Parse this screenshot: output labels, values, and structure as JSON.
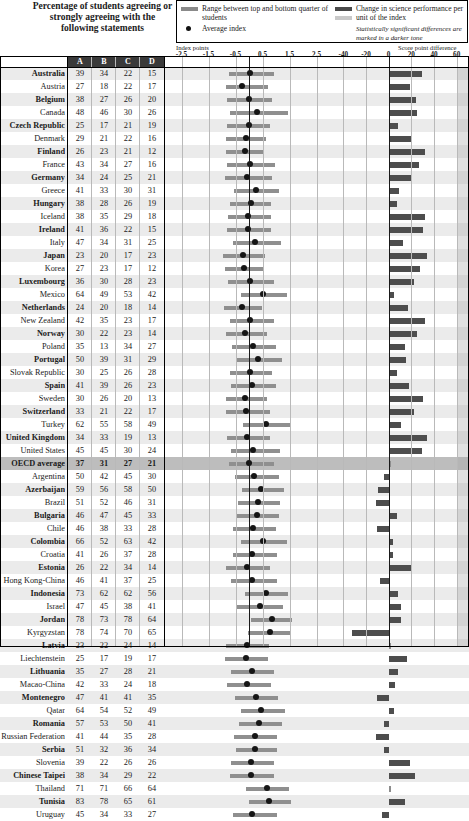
{
  "header": {
    "title": "Percentage of students agreeing or strongly agreeing with the following statements",
    "legend": {
      "range_label": "Range between top and bottom quarter of students",
      "average_label": "Average index",
      "change_label": "Change in science performance per unit of the index",
      "significance_note": "Statistically significant differences are marked in a darker tone"
    }
  },
  "axes": {
    "left_caption": "Index points",
    "right_caption": "Score point difference",
    "left_ticks": [
      "-2.5",
      "-1.5",
      "-0.5",
      "0.5",
      "1.5",
      "2.5"
    ],
    "right_ticks": [
      "-40",
      "-20",
      "0",
      "20",
      "40",
      "60"
    ],
    "left_range": [
      -3.0,
      3.0
    ],
    "right_range": [
      -50,
      70
    ]
  },
  "table": {
    "columns": [
      "A",
      "B",
      "C",
      "D"
    ]
  },
  "chart_data": {
    "type": "table",
    "title": "Percentage of students agreeing or strongly agreeing with the following statements",
    "xlabel": "Index points / Score point difference",
    "ylabel": "Country",
    "legend": [
      "Range between top and bottom quarter of students",
      "Average index",
      "Change in science performance per unit of the index"
    ],
    "categories": [
      "Australia",
      "Austria",
      "Belgium",
      "Canada",
      "Czech Republic",
      "Denmark",
      "Finland",
      "France",
      "Germany",
      "Greece",
      "Hungary",
      "Iceland",
      "Ireland",
      "Italy",
      "Japan",
      "Korea",
      "Luxembourg",
      "Mexico",
      "Netherlands",
      "New Zealand",
      "Norway",
      "Poland",
      "Portugal",
      "Slovak Republic",
      "Spain",
      "Sweden",
      "Switzerland",
      "Turkey",
      "United Kingdom",
      "United States",
      "OECD average",
      "Argentina",
      "Azerbaijan",
      "Brazil",
      "Bulgaria",
      "Chile",
      "Colombia",
      "Croatia",
      "Estonia",
      "Hong Kong-China",
      "Indonesia",
      "Israel",
      "Jordan",
      "Kyrgyzstan",
      "Latvia",
      "Liechtenstein",
      "Lithuania",
      "Macao-China",
      "Montenegro",
      "Qatar",
      "Romania",
      "Russian Federation",
      "Serbia",
      "Slovenia",
      "Chinese Taipei",
      "Thailand",
      "Tunisia",
      "Uruguay"
    ],
    "rows": [
      {
        "country": "Australia",
        "bold": true,
        "oecd": false,
        "A": 39,
        "B": 34,
        "C": 22,
        "D": 15,
        "index_low": -0.73,
        "index_high": 0.92,
        "index_avg": 0.03,
        "score_diff": 29,
        "significant": true
      },
      {
        "country": "Austria",
        "bold": false,
        "oecd": false,
        "A": 27,
        "B": 18,
        "C": 22,
        "D": 17,
        "index_low": -0.85,
        "index_high": 0.72,
        "index_avg": -0.27,
        "score_diff": 19,
        "significant": true
      },
      {
        "country": "Belgium",
        "bold": true,
        "oecd": false,
        "A": 38,
        "B": 27,
        "C": 26,
        "D": 20,
        "index_low": -0.8,
        "index_high": 0.86,
        "index_avg": 0.0,
        "score_diff": 24,
        "significant": true
      },
      {
        "country": "Canada",
        "bold": false,
        "oecd": false,
        "A": 48,
        "B": 46,
        "C": 30,
        "D": 26,
        "index_low": -0.7,
        "index_high": 1.45,
        "index_avg": 0.28,
        "score_diff": 25,
        "significant": true
      },
      {
        "country": "Czech Republic",
        "bold": true,
        "oecd": false,
        "A": 25,
        "B": 17,
        "C": 21,
        "D": 19,
        "index_low": -0.82,
        "index_high": 0.78,
        "index_avg": 0.0,
        "score_diff": 8,
        "significant": true
      },
      {
        "country": "Denmark",
        "bold": false,
        "oecd": false,
        "A": 29,
        "B": 21,
        "C": 22,
        "D": 16,
        "index_low": -0.84,
        "index_high": 0.62,
        "index_avg": -0.12,
        "score_diff": 20,
        "significant": true
      },
      {
        "country": "Finland",
        "bold": true,
        "oecd": false,
        "A": 26,
        "B": 23,
        "C": 21,
        "D": 12,
        "index_low": -0.86,
        "index_high": 0.52,
        "index_avg": -0.14,
        "score_diff": 32,
        "significant": true
      },
      {
        "country": "France",
        "bold": false,
        "oecd": false,
        "A": 43,
        "B": 34,
        "C": 27,
        "D": 16,
        "index_low": -0.8,
        "index_high": 0.96,
        "index_avg": 0.02,
        "score_diff": 27,
        "significant": true
      },
      {
        "country": "Germany",
        "bold": true,
        "oecd": false,
        "A": 34,
        "B": 24,
        "C": 25,
        "D": 21,
        "index_low": -0.88,
        "index_high": 0.86,
        "index_avg": -0.08,
        "score_diff": 20,
        "significant": true
      },
      {
        "country": "Greece",
        "bold": false,
        "oecd": false,
        "A": 41,
        "B": 33,
        "C": 30,
        "D": 31,
        "index_low": -0.55,
        "index_high": 1.1,
        "index_avg": 0.25,
        "score_diff": 9,
        "significant": true
      },
      {
        "country": "Hungary",
        "bold": true,
        "oecd": false,
        "A": 38,
        "B": 28,
        "C": 26,
        "D": 19,
        "index_low": -0.7,
        "index_high": 0.8,
        "index_avg": 0.06,
        "score_diff": 7,
        "significant": true
      },
      {
        "country": "Iceland",
        "bold": false,
        "oecd": false,
        "A": 38,
        "B": 35,
        "C": 29,
        "D": 18,
        "index_low": -0.78,
        "index_high": 0.8,
        "index_avg": -0.02,
        "score_diff": 32,
        "significant": true
      },
      {
        "country": "Ireland",
        "bold": true,
        "oecd": false,
        "A": 41,
        "B": 36,
        "C": 22,
        "D": 15,
        "index_low": -0.8,
        "index_high": 0.8,
        "index_avg": -0.03,
        "score_diff": 30,
        "significant": true
      },
      {
        "country": "Italy",
        "bold": false,
        "oecd": false,
        "A": 47,
        "B": 34,
        "C": 31,
        "D": 25,
        "index_low": -0.58,
        "index_high": 1.18,
        "index_avg": 0.24,
        "score_diff": 13,
        "significant": true
      },
      {
        "country": "Japan",
        "bold": true,
        "oecd": false,
        "A": 23,
        "B": 20,
        "C": 17,
        "D": 23,
        "index_low": -0.95,
        "index_high": 0.58,
        "index_avg": -0.22,
        "score_diff": 34,
        "significant": true
      },
      {
        "country": "Korea",
        "bold": false,
        "oecd": false,
        "A": 27,
        "B": 23,
        "C": 17,
        "D": 12,
        "index_low": -0.9,
        "index_high": 0.56,
        "index_avg": -0.2,
        "score_diff": 28,
        "significant": true
      },
      {
        "country": "Luxembourg",
        "bold": true,
        "oecd": false,
        "A": 36,
        "B": 30,
        "C": 28,
        "D": 23,
        "index_low": -0.78,
        "index_high": 0.92,
        "index_avg": 0.02,
        "score_diff": 22,
        "significant": true
      },
      {
        "country": "Mexico",
        "bold": false,
        "oecd": false,
        "A": 64,
        "B": 49,
        "C": 53,
        "D": 42,
        "index_low": -0.3,
        "index_high": 1.42,
        "index_avg": 0.52,
        "score_diff": 5,
        "significant": true
      },
      {
        "country": "Netherlands",
        "bold": true,
        "oecd": false,
        "A": 24,
        "B": 20,
        "C": 18,
        "D": 14,
        "index_low": -0.92,
        "index_high": 0.48,
        "index_avg": -0.26,
        "score_diff": 17,
        "significant": true
      },
      {
        "country": "New Zealand",
        "bold": false,
        "oecd": false,
        "A": 42,
        "B": 35,
        "C": 23,
        "D": 17,
        "index_low": -0.72,
        "index_high": 0.94,
        "index_avg": 0.04,
        "score_diff": 32,
        "significant": true
      },
      {
        "country": "Norway",
        "bold": true,
        "oecd": false,
        "A": 30,
        "B": 22,
        "C": 23,
        "D": 14,
        "index_low": -0.84,
        "index_high": 0.66,
        "index_avg": -0.14,
        "score_diff": 25,
        "significant": true
      },
      {
        "country": "Poland",
        "bold": false,
        "oecd": false,
        "A": 35,
        "B": 13,
        "C": 34,
        "D": 27,
        "index_low": -0.62,
        "index_high": 1.0,
        "index_avg": 0.14,
        "score_diff": 14,
        "significant": true
      },
      {
        "country": "Portugal",
        "bold": true,
        "oecd": false,
        "A": 50,
        "B": 39,
        "C": 31,
        "D": 29,
        "index_low": -0.48,
        "index_high": 1.22,
        "index_avg": 0.34,
        "score_diff": 15,
        "significant": true
      },
      {
        "country": "Slovak Republic",
        "bold": false,
        "oecd": false,
        "A": 30,
        "B": 25,
        "C": 26,
        "D": 28,
        "index_low": -0.72,
        "index_high": 0.86,
        "index_avg": 0.02,
        "score_diff": 7,
        "significant": true
      },
      {
        "country": "Spain",
        "bold": true,
        "oecd": false,
        "A": 41,
        "B": 39,
        "C": 26,
        "D": 23,
        "index_low": -0.68,
        "index_high": 1.0,
        "index_avg": 0.1,
        "score_diff": 18,
        "significant": true
      },
      {
        "country": "Sweden",
        "bold": false,
        "oecd": false,
        "A": 30,
        "B": 26,
        "C": 20,
        "D": 13,
        "index_low": -0.86,
        "index_high": 0.68,
        "index_avg": -0.14,
        "score_diff": 30,
        "significant": true
      },
      {
        "country": "Switzerland",
        "bold": true,
        "oecd": false,
        "A": 33,
        "B": 21,
        "C": 22,
        "D": 17,
        "index_low": -0.86,
        "index_high": 0.76,
        "index_avg": -0.1,
        "score_diff": 22,
        "significant": true
      },
      {
        "country": "Turkey",
        "bold": false,
        "oecd": false,
        "A": 62,
        "B": 55,
        "C": 58,
        "D": 49,
        "index_low": -0.22,
        "index_high": 1.52,
        "index_avg": 0.62,
        "score_diff": 11,
        "significant": true
      },
      {
        "country": "United Kingdom",
        "bold": true,
        "oecd": false,
        "A": 34,
        "B": 33,
        "C": 19,
        "D": 13,
        "index_low": -0.82,
        "index_high": 0.76,
        "index_avg": -0.06,
        "score_diff": 34,
        "significant": true
      },
      {
        "country": "United States",
        "bold": false,
        "oecd": false,
        "A": 45,
        "B": 45,
        "C": 30,
        "D": 24,
        "index_low": -0.66,
        "index_high": 1.14,
        "index_avg": 0.14,
        "score_diff": 29,
        "significant": true
      },
      {
        "country": "OECD average",
        "bold": true,
        "oecd": true,
        "A": 37,
        "B": 31,
        "C": 27,
        "D": 21,
        "index_low": -0.74,
        "index_high": 0.92,
        "index_avg": 0.0,
        "score_diff": 2,
        "significant": false
      },
      {
        "country": "Argentina",
        "bold": false,
        "oecd": false,
        "A": 50,
        "B": 42,
        "C": 45,
        "D": 30,
        "index_low": -0.52,
        "index_high": 1.12,
        "index_avg": 0.2,
        "score_diff": -4,
        "significant": true
      },
      {
        "country": "Azerbaijan",
        "bold": true,
        "oecd": false,
        "A": 59,
        "B": 56,
        "C": 58,
        "D": 50,
        "index_low": -0.26,
        "index_high": 1.3,
        "index_avg": 0.46,
        "score_diff": -9,
        "significant": true
      },
      {
        "country": "Brazil",
        "bold": false,
        "oecd": false,
        "A": 51,
        "B": 52,
        "C": 46,
        "D": 31,
        "index_low": -0.42,
        "index_high": 1.16,
        "index_avg": 0.32,
        "score_diff": -11,
        "significant": true
      },
      {
        "country": "Bulgaria",
        "bold": true,
        "oecd": false,
        "A": 46,
        "B": 47,
        "C": 45,
        "D": 33,
        "index_low": -0.44,
        "index_high": 1.12,
        "index_avg": 0.3,
        "score_diff": 7,
        "significant": true
      },
      {
        "country": "Chile",
        "bold": false,
        "oecd": false,
        "A": 46,
        "B": 38,
        "C": 33,
        "D": 28,
        "index_low": -0.6,
        "index_high": 1.0,
        "index_avg": 0.16,
        "score_diff": -10,
        "significant": true
      },
      {
        "country": "Colombia",
        "bold": true,
        "oecd": false,
        "A": 66,
        "B": 52,
        "C": 63,
        "D": 42,
        "index_low": -0.3,
        "index_high": 1.4,
        "index_avg": 0.5,
        "score_diff": 4,
        "significant": true
      },
      {
        "country": "Croatia",
        "bold": false,
        "oecd": false,
        "A": 41,
        "B": 26,
        "C": 37,
        "D": 28,
        "index_low": -0.6,
        "index_high": 1.02,
        "index_avg": 0.12,
        "score_diff": 4,
        "significant": true
      },
      {
        "country": "Estonia",
        "bold": true,
        "oecd": false,
        "A": 26,
        "B": 22,
        "C": 34,
        "D": 14,
        "index_low": -0.86,
        "index_high": 0.78,
        "index_avg": -0.06,
        "score_diff": 20,
        "significant": true
      },
      {
        "country": "Hong Kong-China",
        "bold": false,
        "oecd": false,
        "A": 46,
        "B": 41,
        "C": 37,
        "D": 25,
        "index_low": -0.66,
        "index_high": 1.02,
        "index_avg": 0.12,
        "score_diff": -8,
        "significant": true
      },
      {
        "country": "Indonesia",
        "bold": true,
        "oecd": false,
        "A": 73,
        "B": 62,
        "C": 62,
        "D": 56,
        "index_low": -0.16,
        "index_high": 1.46,
        "index_avg": 0.64,
        "score_diff": 8,
        "significant": true
      },
      {
        "country": "Israel",
        "bold": false,
        "oecd": false,
        "A": 47,
        "B": 45,
        "C": 38,
        "D": 41,
        "index_low": -0.44,
        "index_high": 1.26,
        "index_avg": 0.4,
        "score_diff": 11,
        "significant": true
      },
      {
        "country": "Jordan",
        "bold": true,
        "oecd": false,
        "A": 78,
        "B": 73,
        "C": 78,
        "D": 64,
        "index_low": 0.08,
        "index_high": 1.6,
        "index_avg": 0.84,
        "score_diff": 11,
        "significant": true
      },
      {
        "country": "Kyrgyzstan",
        "bold": false,
        "oecd": false,
        "A": 78,
        "B": 74,
        "C": 70,
        "D": 65,
        "index_low": -0.02,
        "index_high": 1.54,
        "index_avg": 0.76,
        "score_diff": -32,
        "significant": true
      },
      {
        "country": "Latvia",
        "bold": true,
        "oecd": false,
        "A": 23,
        "B": 22,
        "C": 24,
        "D": 14,
        "index_low": -0.84,
        "index_high": 0.74,
        "index_avg": -0.06,
        "score_diff": 2,
        "significant": false
      },
      {
        "country": "Liechtenstein",
        "bold": false,
        "oecd": false,
        "A": 25,
        "B": 17,
        "C": 19,
        "D": 17,
        "index_low": -0.88,
        "index_high": 0.7,
        "index_avg": -0.12,
        "score_diff": 16,
        "significant": true
      },
      {
        "country": "Lithuania",
        "bold": true,
        "oecd": false,
        "A": 35,
        "B": 27,
        "C": 28,
        "D": 21,
        "index_low": -0.68,
        "index_high": 0.94,
        "index_avg": 0.12,
        "score_diff": 8,
        "significant": true
      },
      {
        "country": "Macao-China",
        "bold": false,
        "oecd": false,
        "A": 42,
        "B": 33,
        "C": 24,
        "D": 18,
        "index_low": -0.8,
        "index_high": 0.8,
        "index_avg": -0.08,
        "score_diff": 6,
        "significant": true
      },
      {
        "country": "Montenegro",
        "bold": true,
        "oecd": false,
        "A": 47,
        "B": 41,
        "C": 41,
        "D": 35,
        "index_low": -0.52,
        "index_high": 1.08,
        "index_avg": 0.26,
        "score_diff": -10,
        "significant": true
      },
      {
        "country": "Qatar",
        "bold": false,
        "oecd": false,
        "A": 64,
        "B": 54,
        "C": 52,
        "D": 49,
        "index_low": -0.3,
        "index_high": 1.32,
        "index_avg": 0.46,
        "score_diff": 5,
        "significant": true
      },
      {
        "country": "Romania",
        "bold": true,
        "oecd": false,
        "A": 57,
        "B": 53,
        "C": 50,
        "D": 41,
        "index_low": -0.38,
        "index_high": 1.22,
        "index_avg": 0.36,
        "score_diff": -4,
        "significant": true
      },
      {
        "country": "Russian Federation",
        "bold": false,
        "oecd": false,
        "A": 41,
        "B": 44,
        "C": 35,
        "D": 28,
        "index_low": -0.56,
        "index_high": 1.04,
        "index_avg": 0.22,
        "score_diff": -11,
        "significant": true
      },
      {
        "country": "Serbia",
        "bold": true,
        "oecd": false,
        "A": 51,
        "B": 32,
        "C": 36,
        "D": 34,
        "index_low": -0.5,
        "index_high": 1.04,
        "index_avg": 0.22,
        "score_diff": -4,
        "significant": true
      },
      {
        "country": "Slovenia",
        "bold": false,
        "oecd": false,
        "A": 39,
        "B": 22,
        "C": 26,
        "D": 26,
        "index_low": -0.68,
        "index_high": 0.92,
        "index_avg": 0.08,
        "score_diff": 19,
        "significant": true
      },
      {
        "country": "Chinese Taipei",
        "bold": true,
        "oecd": false,
        "A": 38,
        "B": 34,
        "C": 29,
        "D": 22,
        "index_low": -0.72,
        "index_high": 0.92,
        "index_avg": 0.06,
        "score_diff": 23,
        "significant": true
      },
      {
        "country": "Thailand",
        "bold": false,
        "oecd": false,
        "A": 71,
        "B": 71,
        "C": 66,
        "D": 64,
        "index_low": -0.1,
        "index_high": 1.48,
        "index_avg": 0.68,
        "score_diff": 1,
        "significant": false
      },
      {
        "country": "Tunisia",
        "bold": true,
        "oecd": false,
        "A": 83,
        "B": 78,
        "C": 65,
        "D": 61,
        "index_low": 0.0,
        "index_high": 1.56,
        "index_avg": 0.74,
        "score_diff": 14,
        "significant": true
      },
      {
        "country": "Uruguay",
        "bold": false,
        "oecd": false,
        "A": 45,
        "B": 34,
        "C": 33,
        "D": 27,
        "index_low": -0.6,
        "index_high": 1.02,
        "index_avg": 0.1,
        "score_diff": -6,
        "significant": true
      }
    ]
  }
}
